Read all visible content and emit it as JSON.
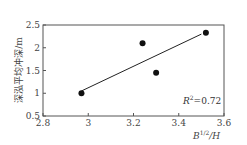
{
  "chart_data": {
    "type": "scatter",
    "title": "",
    "xlabel": "B^{1/2}/H",
    "ylabel": "深泓平均冲深/m",
    "xlim": [
      2.8,
      3.6
    ],
    "ylim": [
      0.5,
      2.5
    ],
    "xticks": [
      2.8,
      3.0,
      3.2,
      3.4,
      3.6
    ],
    "xtick_labels": [
      "2.8",
      "3",
      "3.2",
      "3.4",
      "3.6"
    ],
    "yticks": [
      0.5,
      1.0,
      1.5,
      2.0,
      2.5
    ],
    "ytick_labels": [
      "0.5",
      "1",
      "1.5",
      "2",
      "2.5"
    ],
    "grid": false,
    "series": [
      {
        "name": "observed",
        "type": "scatter",
        "x": [
          2.97,
          3.24,
          3.3,
          3.52
        ],
        "y": [
          1.0,
          2.1,
          1.45,
          2.33
        ]
      },
      {
        "name": "linear fit",
        "type": "line",
        "x": [
          2.97,
          3.5
        ],
        "y": [
          1.05,
          2.3
        ]
      }
    ],
    "annotations": [
      {
        "text": "R²=0.72",
        "x": 3.5,
        "y": 0.72
      }
    ]
  },
  "labels": {
    "ylabel": "深泓平均冲深/m",
    "xlabel_base": "B",
    "xlabel_sup": "1/2",
    "xlabel_tail": "/H",
    "r2_base": "R",
    "r2_sup": "2",
    "r2_tail": "=0.72"
  }
}
